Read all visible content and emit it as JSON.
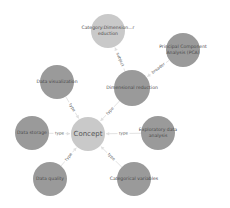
{
  "graph": {
    "background": "#ffffff",
    "nodes": [
      {
        "id": "category",
        "lines": [
          "Category:Dimension...r",
          "eduction"
        ],
        "x": 108,
        "y": 31,
        "r": 17,
        "color": "#c9c9c9"
      },
      {
        "id": "pca",
        "lines": [
          "Principal Component",
          "Analysis (PCA)"
        ],
        "x": 183,
        "y": 50,
        "r": 17,
        "color": "#9a9a9a"
      },
      {
        "id": "dimred",
        "lines": [
          "Dimensional reduction"
        ],
        "x": 132,
        "y": 88,
        "r": 18,
        "color": "#9a9a9a"
      },
      {
        "id": "dataviz",
        "lines": [
          "Data visualization"
        ],
        "x": 57,
        "y": 82,
        "r": 17,
        "color": "#9a9a9a"
      },
      {
        "id": "concept",
        "lines": [
          "Concept"
        ],
        "x": 88,
        "y": 134,
        "r": 17,
        "color": "#c9c9c9",
        "big": true
      },
      {
        "id": "storage",
        "lines": [
          "Data storage"
        ],
        "x": 32,
        "y": 133,
        "r": 17,
        "color": "#9a9a9a"
      },
      {
        "id": "eda",
        "lines": [
          "Exploratory data",
          "analysis"
        ],
        "x": 158,
        "y": 133,
        "r": 17,
        "color": "#9a9a9a"
      },
      {
        "id": "quality",
        "lines": [
          "Data quality"
        ],
        "x": 50,
        "y": 179,
        "r": 17,
        "color": "#9a9a9a"
      },
      {
        "id": "catvar",
        "lines": [
          "Categorical variables"
        ],
        "x": 134,
        "y": 179,
        "r": 17,
        "color": "#9a9a9a"
      }
    ],
    "edges": [
      {
        "from": "dimred",
        "to": "category",
        "label": "subject"
      },
      {
        "from": "pca",
        "to": "dimred",
        "label": "broader"
      },
      {
        "from": "dimred",
        "to": "concept",
        "label": "type"
      },
      {
        "from": "dataviz",
        "to": "concept",
        "label": "type"
      },
      {
        "from": "storage",
        "to": "concept",
        "label": "type"
      },
      {
        "from": "eda",
        "to": "concept",
        "label": "type"
      },
      {
        "from": "quality",
        "to": "concept",
        "label": "type"
      },
      {
        "from": "catvar",
        "to": "concept",
        "label": "type"
      }
    ]
  }
}
